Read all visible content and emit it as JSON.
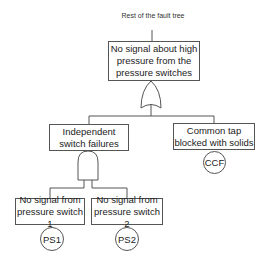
{
  "diagram": {
    "type": "fault-tree",
    "top_label": "Rest of the fault tree",
    "top_event": {
      "text": "No signal about high pressure from the pressure switches",
      "gate": "OR"
    },
    "intermediate_events": [
      {
        "id": "independent",
        "text": "Independent switch failures",
        "gate": "AND"
      },
      {
        "id": "common-tap",
        "text": "Common tap blocked with solids",
        "basic_event_label": "CCF"
      }
    ],
    "basic_events": [
      {
        "text": "No signal from pressure switch 1",
        "label": "PS1"
      },
      {
        "text": "No signal from pressure switch 2",
        "label": "PS2"
      }
    ]
  },
  "colors": {
    "line": "#555555",
    "text": "#222222",
    "background": "#ffffff"
  }
}
